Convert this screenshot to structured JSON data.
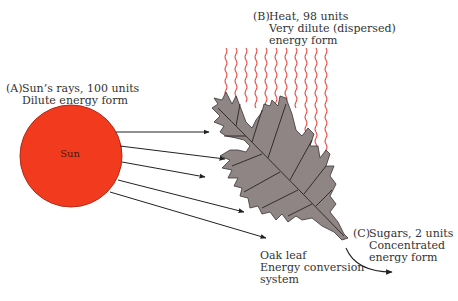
{
  "figure": {
    "label_a": {
      "tag": "(A)",
      "line1": "Sun’s rays, 100 units",
      "line2": "Dilute energy form"
    },
    "label_b": {
      "tag": "(B)",
      "line1": "Heat, 98 units",
      "line2": "Very dilute (dispersed)",
      "line3": "energy form"
    },
    "label_c": {
      "tag": "(C)",
      "line1": "Sugars, 2 units",
      "line2": "Concentrated",
      "line3": "energy form"
    },
    "leaf_label": {
      "line1": "Oak leaf",
      "line2": "Energy conversion",
      "line3": "system"
    },
    "sun_label": "Sun",
    "colors": {
      "sun_fill": "#f23a1e",
      "sun_stroke": "#b02a18",
      "leaf_fill": "#8f8585",
      "leaf_stroke": "#3a3333",
      "heat_wave": "#e8544a",
      "arrow": "#222222"
    }
  }
}
